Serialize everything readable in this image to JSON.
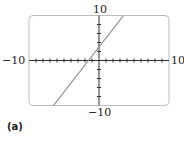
{
  "chart_data": {
    "type": "line",
    "title": "",
    "panel_label": "(a)",
    "xlabel": "",
    "ylabel": "",
    "xlim": [
      -10,
      10
    ],
    "ylim": [
      -10,
      10
    ],
    "x_tick_step": 1,
    "y_tick_step": 2,
    "grid": false,
    "axis_labels": {
      "x_min": "−10",
      "x_max": "10",
      "y_min": "−10",
      "y_max": "10"
    },
    "series": [
      {
        "name": "y = 2x + 3",
        "slope": 2,
        "intercept": 3,
        "x": [
          -6.5,
          3.5
        ],
        "y": [
          -10,
          10
        ],
        "color": "#8a8a8a"
      }
    ],
    "colors": {
      "frame": "#bdbdbd",
      "axis": "#333333",
      "line": "#8a8a8a"
    }
  }
}
